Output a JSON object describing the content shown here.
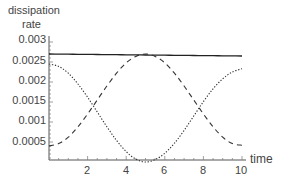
{
  "chart_data": {
    "type": "line",
    "title": "",
    "ylabel": "dissipation rate",
    "ylabel_lines": [
      "dissipation",
      "rate"
    ],
    "xlabel": "time",
    "xlim": [
      0,
      10
    ],
    "ylim": [
      0,
      0.003
    ],
    "grid": false,
    "legend": null,
    "xticks": [
      2,
      4,
      6,
      8,
      10
    ],
    "xtick_labels": [
      "2",
      "4",
      "6",
      "8",
      "10"
    ],
    "yticks": [
      0.0005,
      0.001,
      0.0015,
      0.002,
      0.0025,
      0.003
    ],
    "ytick_labels": [
      "0.0005",
      "0.001",
      "0.0015",
      "0.002",
      "0.0025",
      "0.003"
    ],
    "x": [
      0,
      0.5,
      1,
      1.5,
      2,
      2.5,
      3,
      3.5,
      4,
      4.5,
      5,
      5.5,
      6,
      6.5,
      7,
      7.5,
      8,
      8.5,
      9,
      9.5,
      10
    ],
    "series": [
      {
        "name": "total",
        "style": "solid",
        "values": [
          0.0027,
          0.002698,
          0.002695,
          0.002693,
          0.00269,
          0.002688,
          0.002685,
          0.002683,
          0.00268,
          0.002678,
          0.002675,
          0.002673,
          0.00267,
          0.002668,
          0.002665,
          0.002663,
          0.00266,
          0.002658,
          0.002655,
          0.002653,
          0.00265
        ]
      },
      {
        "name": "dashed",
        "style": "dashed",
        "values": [
          0.0004,
          0.00046,
          0.00062,
          0.00088,
          0.0012,
          0.00155,
          0.0019,
          0.00222,
          0.00248,
          0.00264,
          0.0027,
          0.00264,
          0.00248,
          0.00222,
          0.0019,
          0.00155,
          0.0012,
          0.00088,
          0.00062,
          0.00046,
          0.00042
        ]
      },
      {
        "name": "dotted",
        "style": "dotted",
        "values": [
          0.00245,
          0.00239,
          0.00222,
          0.00195,
          0.00162,
          0.00125,
          0.00088,
          0.00054,
          0.00026,
          7e-05,
          0.0,
          6e-05,
          0.00022,
          0.00047,
          0.00079,
          0.00115,
          0.00151,
          0.00183,
          0.00208,
          0.00225,
          0.00233
        ]
      }
    ]
  },
  "plot_area": {
    "left": 49,
    "right": 242,
    "top": 38,
    "bottom": 160
  }
}
